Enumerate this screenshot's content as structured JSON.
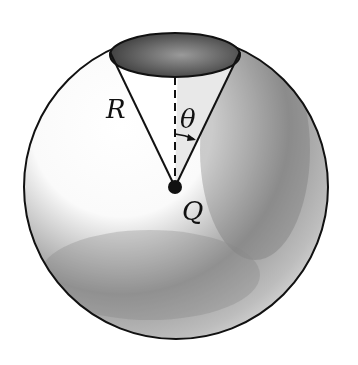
{
  "diagram": {
    "labels": {
      "radius": "R",
      "angle": "θ",
      "charge": "Q"
    },
    "colors": {
      "outline": "#111111",
      "shade_dark": "#555555",
      "shade_light": "#ffffff",
      "cap": "#5a5a5a"
    }
  }
}
